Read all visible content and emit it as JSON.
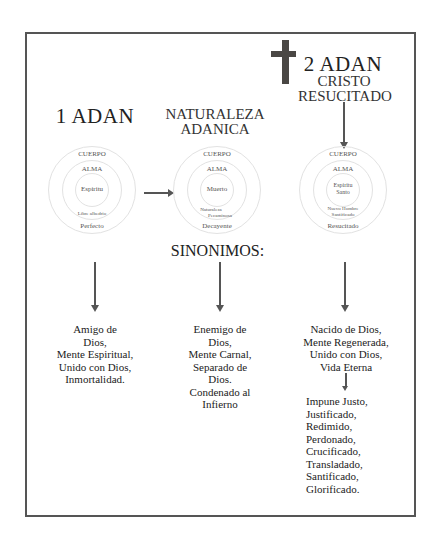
{
  "headings": {
    "first_adam": "1 ADAN",
    "adamic_nature_line1": "NATURALEZA",
    "adamic_nature_line2": "ADANICA",
    "second_adam": "2 ADAN",
    "risen_christ_line1": "CRISTO",
    "risen_christ_line2": "RESUCITADO",
    "synonyms": "SINONIMOS:"
  },
  "icons": {
    "cross": "cross-icon"
  },
  "circles": [
    {
      "outer": "CUERPO",
      "middle": "ALMA",
      "inner": [
        "Espiritu"
      ],
      "inner_lower": [
        "Libre albedrio"
      ],
      "bottom": "Perfecto"
    },
    {
      "outer": "CUERPO",
      "middle": "ALMA",
      "inner": [
        "Muerto"
      ],
      "inner_lower": [
        "Naturaleza",
        "Pecaminosa"
      ],
      "bottom": "Decayente"
    },
    {
      "outer": "CUERPO",
      "middle": "ALMA",
      "inner": [
        "Espiritu",
        "Santo"
      ],
      "inner_lower": [
        "Nuevo Hombre",
        "Santificado"
      ],
      "bottom": "Resucitado"
    }
  ],
  "lists": {
    "first_adam": [
      "Amigo de",
      "Dios,",
      "Mente Espiritual,",
      "Unido con Dios,",
      "Inmortalidad."
    ],
    "adamic_nature": [
      "Enemigo de",
      "Dios,",
      "Mente Carnal,",
      "Separado de",
      "Dios.",
      "Condenado al",
      "Infierno"
    ],
    "second_adam": [
      "Nacido de Dios,",
      "Mente Regenerada,",
      "Unido con Dios,",
      "Vida Eterna"
    ],
    "second_adam_more": [
      "Impune Justo,",
      "Justificado,",
      "Redimido,",
      "Perdonado,",
      "Crucificado,",
      "Transladado,",
      "Santificado,",
      "Glorificado."
    ]
  }
}
